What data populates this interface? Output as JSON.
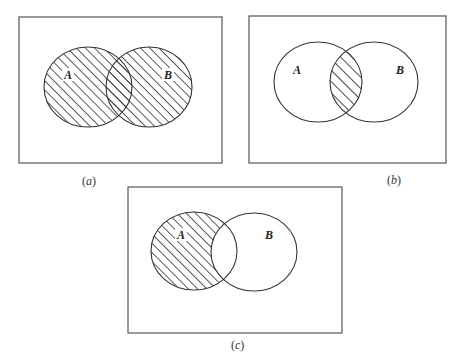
{
  "figure": {
    "panels": [
      {
        "id": "a",
        "caption_open": "(",
        "caption_letter": "a",
        "caption_close": ")",
        "set_labels": [
          "A",
          "B"
        ],
        "shaded_region": "A ∪ B",
        "box": {
          "x": 19,
          "y": 17,
          "w": 203,
          "h": 146
        },
        "circles": [
          {
            "cx": 88,
            "cy": 87,
            "rx": 44,
            "ry": 40
          },
          {
            "cx": 149,
            "cy": 87,
            "rx": 43,
            "ry": 40
          }
        ],
        "label_pos": [
          {
            "x": 64,
            "y": 78
          },
          {
            "x": 165,
            "y": 78
          }
        ],
        "caption_pos": {
          "x": 90,
          "y": 185
        }
      },
      {
        "id": "b",
        "caption_open": "(",
        "caption_letter": "b",
        "caption_close": ")",
        "set_labels": [
          "A",
          "B"
        ],
        "shaded_region": "A ∩ B",
        "box": {
          "x": 249,
          "y": 16,
          "w": 197,
          "h": 147
        },
        "circles": [
          {
            "cx": 318,
            "cy": 82,
            "rx": 44,
            "ry": 40
          },
          {
            "cx": 374,
            "cy": 82,
            "rx": 44,
            "ry": 40
          }
        ],
        "label_pos": [
          {
            "x": 294,
            "y": 74
          },
          {
            "x": 397,
            "y": 74
          }
        ],
        "caption_pos": {
          "x": 395,
          "y": 184
        }
      },
      {
        "id": "c",
        "caption_open": "(",
        "caption_letter": "c",
        "caption_close": ")",
        "set_labels": [
          "A",
          "B"
        ],
        "shaded_region": "A − B",
        "box": {
          "x": 128,
          "y": 187,
          "w": 214,
          "h": 146
        },
        "circles": [
          {
            "cx": 194,
            "cy": 251,
            "rx": 43,
            "ry": 39
          },
          {
            "cx": 254,
            "cy": 252,
            "rx": 43,
            "ry": 39
          }
        ],
        "label_pos": [
          {
            "x": 177,
            "y": 238
          },
          {
            "x": 265,
            "y": 238
          }
        ],
        "caption_pos": {
          "x": 238,
          "y": 349
        }
      }
    ]
  }
}
